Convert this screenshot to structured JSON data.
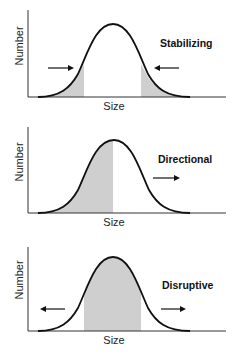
{
  "panels": [
    {
      "id": "stabilizing",
      "title": "Stabilizing",
      "ylabel": "Number",
      "xlabel": "Size",
      "shaded_regions": [
        "left-tail",
        "right-tail"
      ],
      "arrows": [
        "inward-from-left",
        "inward-from-right"
      ]
    },
    {
      "id": "directional",
      "title": "Directional",
      "ylabel": "Number",
      "xlabel": "Size",
      "shaded_regions": [
        "left-half"
      ],
      "arrows": [
        "right"
      ]
    },
    {
      "id": "disruptive",
      "title": "Disruptive",
      "ylabel": "Number",
      "xlabel": "Size",
      "shaded_regions": [
        "center"
      ],
      "arrows": [
        "outward-left",
        "outward-right"
      ]
    }
  ],
  "colors": {
    "curve": "#111111",
    "shade": "#cfcfcf",
    "axis": "#333333"
  }
}
